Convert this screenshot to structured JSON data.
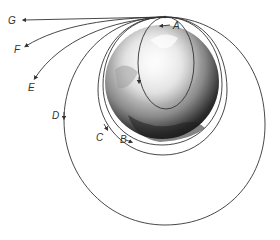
{
  "diagram": {
    "type": "orbital-trajectories",
    "launch_point": {
      "x": 165,
      "y": 17
    },
    "planet": {
      "name": "Earth",
      "cx": 162,
      "cy": 82,
      "r": 57
    },
    "colors": {
      "line": "#333333",
      "background": "#ffffff"
    },
    "labels": {
      "A": "A",
      "B": "B",
      "C": "C",
      "D": "D",
      "E": "E",
      "F": "F",
      "G": "G"
    },
    "trajectories": [
      {
        "id": "A",
        "kind": "ellipse-intersecting-planet"
      },
      {
        "id": "B",
        "kind": "circular-orbit"
      },
      {
        "id": "C",
        "kind": "elliptical-orbit"
      },
      {
        "id": "D",
        "kind": "large-elliptical-orbit"
      },
      {
        "id": "E",
        "kind": "escape-trajectory"
      },
      {
        "id": "F",
        "kind": "escape-trajectory"
      },
      {
        "id": "G",
        "kind": "escape-trajectory"
      }
    ]
  }
}
